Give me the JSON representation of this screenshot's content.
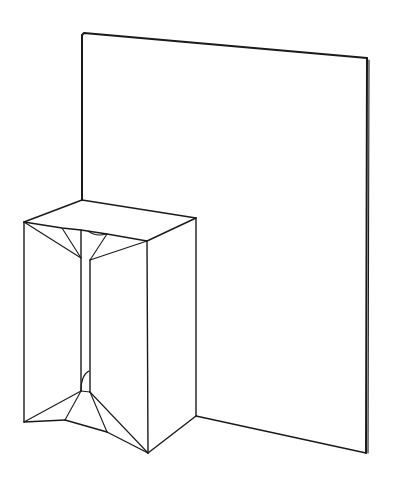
{
  "figure": {
    "stroke_color": "#1a1a1a",
    "background_color": "#ffffff",
    "panel": {
      "top_left": [
        82,
        33
      ],
      "top_right": [
        367,
        58
      ],
      "bottom_right": [
        366,
        453
      ],
      "bottom_meet": [
        196,
        416
      ]
    },
    "box": {
      "top_back_left": [
        82,
        200
      ],
      "top_back_right": [
        196,
        218
      ],
      "top_front_left": [
        24,
        222
      ],
      "top_front_right": [
        147,
        241
      ],
      "bottom_front_left": [
        24,
        422
      ],
      "bottom_front_right": [
        148,
        453
      ],
      "bottom_back_right": [
        196,
        416
      ]
    }
  }
}
